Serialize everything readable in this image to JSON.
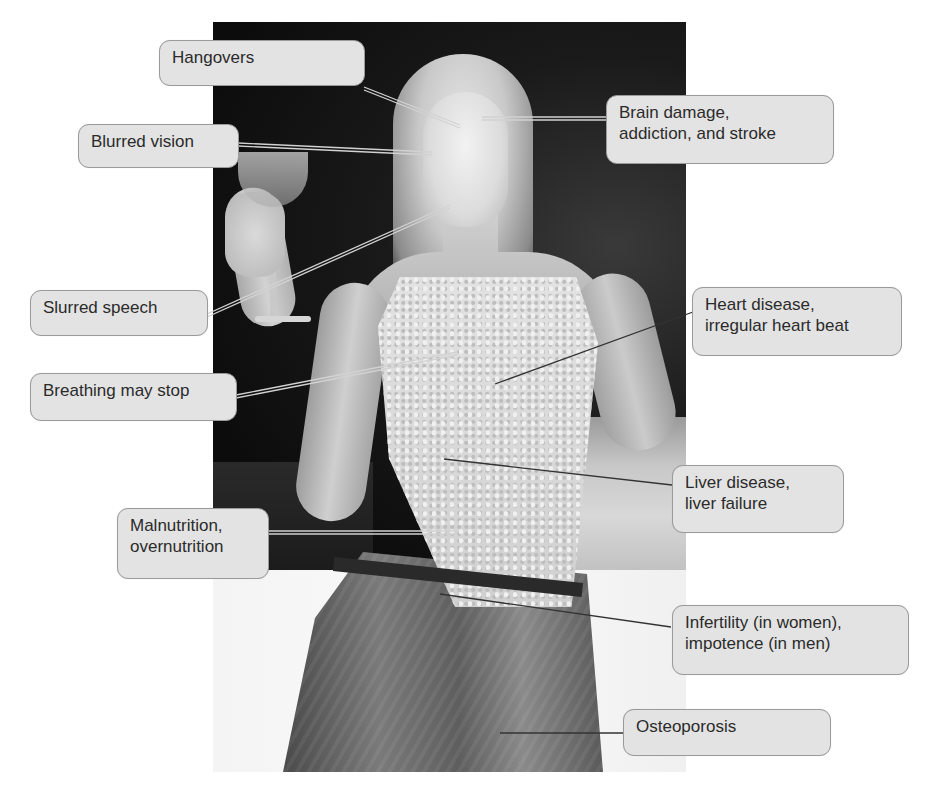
{
  "figure": {
    "type": "labeled-photo-diagram",
    "colors": {
      "background": "#ffffff",
      "label_fill": "#e3e3e3",
      "label_border": "#9a9a9a",
      "label_text": "#2b2b2b",
      "leader_on_dark": "#cfcfcf",
      "leader_on_light": "#3a3a3a"
    }
  },
  "labels": [
    {
      "id": "hangovers",
      "text": "Hangovers",
      "side": "left"
    },
    {
      "id": "blurred-vision",
      "text": "Blurred vision",
      "side": "left"
    },
    {
      "id": "brain-damage",
      "text": "Brain damage,\naddiction, and stroke",
      "side": "right"
    },
    {
      "id": "slurred-speech",
      "text": "Slurred speech",
      "side": "left"
    },
    {
      "id": "heart-disease",
      "text": "Heart disease,\nirregular heart beat",
      "side": "right"
    },
    {
      "id": "breathing",
      "text": "Breathing may stop",
      "side": "left"
    },
    {
      "id": "liver-disease",
      "text": "Liver disease,\nliver failure",
      "side": "right"
    },
    {
      "id": "malnutrition",
      "text": "Malnutrition,\novernutrition",
      "side": "left"
    },
    {
      "id": "infertility",
      "text": "Infertility (in women),\nimpotence (in men)",
      "side": "right"
    },
    {
      "id": "osteoporosis",
      "text": "Osteoporosis",
      "side": "right"
    }
  ]
}
